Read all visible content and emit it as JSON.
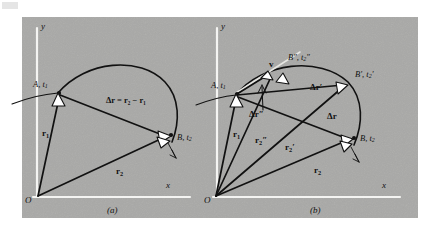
{
  "figure": {
    "background_color": "#a9a9a7",
    "page_color": "#ffffff",
    "ink_color": "#111111",
    "axis_color": "#f2f2f0",
    "arrowhead_fill": "#ffffff",
    "panels": [
      {
        "id": "a",
        "caption": "(a)",
        "axis_y_label": "y",
        "axis_x_label": "x",
        "origin_label": "O",
        "points": [
          {
            "name": "point-a",
            "label": "A, t",
            "sub": "1"
          },
          {
            "name": "point-b",
            "label": "B, t",
            "sub": "2"
          }
        ],
        "vectors": [
          {
            "name": "r1",
            "label": "r",
            "sub": "1",
            "prime": ""
          },
          {
            "name": "r2",
            "label": "r",
            "sub": "2",
            "prime": ""
          }
        ],
        "equation": "Δr = r₂ − r₁"
      },
      {
        "id": "b",
        "caption": "(b)",
        "axis_y_label": "y",
        "axis_x_label": "x",
        "origin_label": "O",
        "velocity_label": "v",
        "points": [
          {
            "name": "point-a",
            "label": "A, t",
            "sub": "1",
            "prime": ""
          },
          {
            "name": "point-b",
            "label": "B, t",
            "sub": "2",
            "prime": ""
          },
          {
            "name": "point-b-prime",
            "label": "B′, t",
            "sub": "2",
            "prime": "′"
          },
          {
            "name": "point-b-double-prime",
            "label": "B″, t",
            "sub": "2",
            "prime": "″"
          }
        ],
        "vectors": [
          {
            "name": "r1",
            "label": "r",
            "sub": "1",
            "prime": ""
          },
          {
            "name": "r2",
            "label": "r",
            "sub": "2",
            "prime": ""
          },
          {
            "name": "r2-prime",
            "label": "r",
            "sub": "2",
            "prime": "′"
          },
          {
            "name": "r2-double-prime",
            "label": "r",
            "sub": "2",
            "prime": "″"
          },
          {
            "name": "delta-r",
            "label": "Δr",
            "prime": ""
          },
          {
            "name": "delta-r-prime",
            "label": "Δr",
            "prime": "′"
          },
          {
            "name": "delta-r-double-prime",
            "label": "Δr",
            "prime": "″"
          }
        ]
      }
    ]
  }
}
